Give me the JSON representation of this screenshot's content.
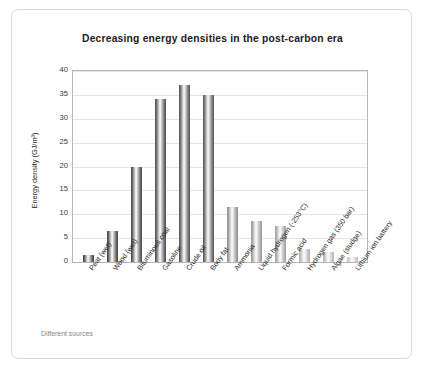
{
  "chart_data": {
    "type": "bar",
    "title": "Decreasing energy densities in the post-carbon era",
    "xlabel": "",
    "ylabel": "Energy density (GJ/m³)",
    "ylim": [
      0,
      40
    ],
    "yticks": [
      0,
      5,
      10,
      15,
      20,
      25,
      30,
      35,
      40
    ],
    "grid": true,
    "legend": false,
    "source_note": "Different sources",
    "categories": [
      "Peat (wet)",
      "Wood (wet)",
      "Bituminous coal",
      "Gasoline",
      "Crude oil",
      "Body fat",
      "Ammonia",
      "Liquid hydrogen (-253°C)",
      "Formic acid",
      "Hydrogen gas (350 bar)",
      "Algae (sludge)",
      "Lithium ion battery"
    ],
    "values": [
      1.5,
      6.5,
      20.0,
      34.2,
      37.0,
      35.0,
      11.5,
      8.5,
      7.5,
      2.7,
      2.0,
      1.0
    ],
    "bar_shades": [
      "#4a4a4a",
      "#4d4d4d",
      "#525252",
      "#575757",
      "#5c5c5c",
      "#616161",
      "#949494",
      "#9e9e9e",
      "#a5a5a5",
      "#b4b4b4",
      "#bcbcbc",
      "#c4c4c4"
    ]
  },
  "colors": {
    "card_border": "#d9d9d9",
    "axis_frame": "#b6b6b6",
    "gridline": "#e4e4e4",
    "title_text": "#23201e",
    "note_text": "#8a8683"
  }
}
